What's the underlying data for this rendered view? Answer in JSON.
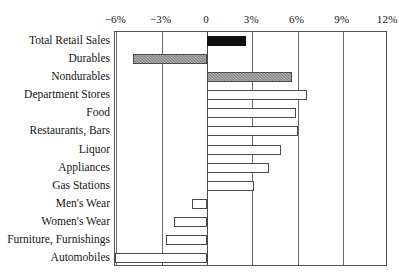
{
  "chart_data": {
    "type": "bar",
    "orientation": "horizontal",
    "title": "",
    "subtitle": "",
    "xlabel": "",
    "ylabel": "",
    "xlim": [
      -6.9,
      12.4
    ],
    "grid": true,
    "legend": false,
    "axis_position": "top",
    "tick_labels": [
      "−6%",
      "−3%",
      "0",
      "3%",
      "6%",
      "9%",
      "12%"
    ],
    "tick_values": [
      -6,
      -3,
      0,
      3,
      6,
      9,
      12
    ],
    "categories": [
      "Total Retail Sales",
      "Durables",
      "Nondurables",
      "Department Stores",
      "Food",
      "Restaurants, Bars",
      "Liquor",
      "Appliances",
      "Gas Stations",
      "Men's Wear",
      "Women's Wear",
      "Furniture, Furnishings",
      "Automobiles"
    ],
    "values": [
      2.6,
      -4.9,
      5.6,
      6.6,
      5.9,
      6.0,
      4.9,
      4.1,
      3.1,
      -1.0,
      -2.2,
      -2.7,
      -6.1
    ],
    "fills": [
      "solid",
      "hatch",
      "hatch",
      "none",
      "none",
      "none",
      "none",
      "none",
      "none",
      "none",
      "none",
      "none",
      "none"
    ],
    "colors": {
      "solid": "#101010",
      "hatch": "#d7d7d7",
      "none": "#ffffff",
      "outline": "#4a4a4a",
      "gridline": "#6a6a6a",
      "text": "#141414",
      "background": "#ffffff"
    }
  }
}
